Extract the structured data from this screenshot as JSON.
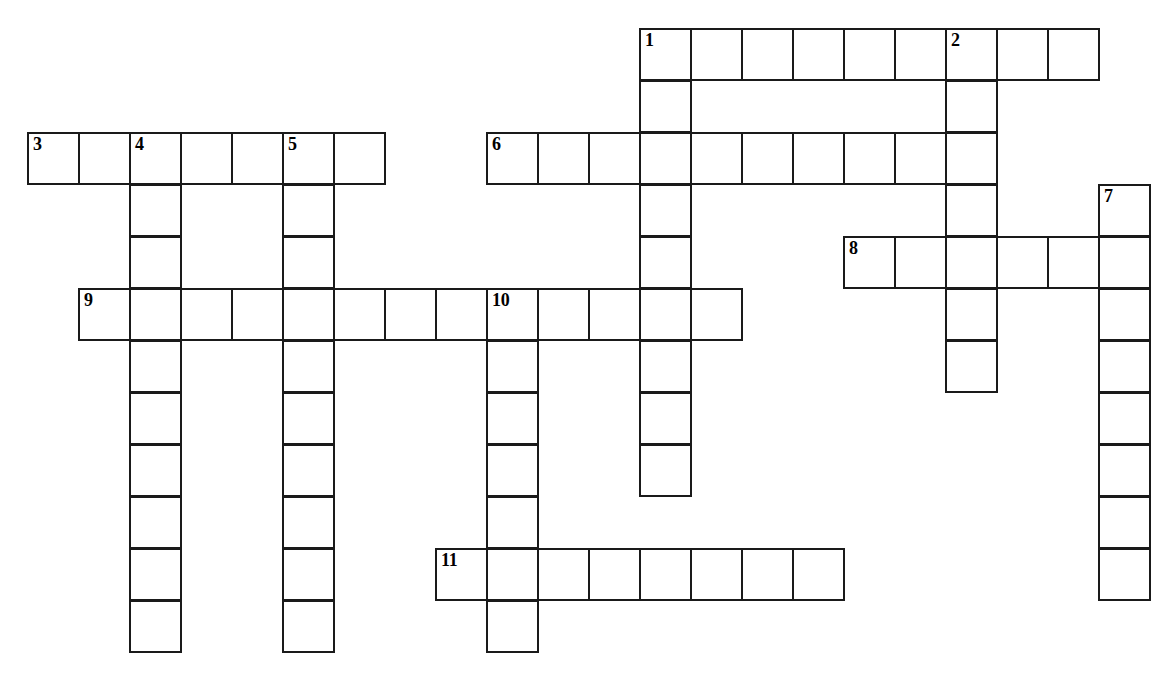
{
  "puzzle": {
    "type": "crossword-grid",
    "title": "Crossword puzzle grid",
    "background_color": "#ffffff",
    "cell_border_color": "#1a1a1a",
    "cell_size_px": 51,
    "row_height_px": 52,
    "origin_x_px": 27,
    "origin_y_px": 28,
    "grid_columns": 22,
    "grid_rows": 13,
    "number_count": 11,
    "entries": [
      {
        "number": "1",
        "direction": "across",
        "row": 0,
        "col": 12,
        "length": 9,
        "numbered_cell_index": 0
      },
      {
        "number": "1",
        "direction": "down",
        "row": 0,
        "col": 12,
        "length": 9,
        "numbered_cell_index": 0
      },
      {
        "number": "2",
        "direction": "down",
        "row": 0,
        "col": 18,
        "length": 7,
        "numbered_cell_index": 0
      },
      {
        "number": "3",
        "direction": "across",
        "row": 2,
        "col": 0,
        "length": 7,
        "numbered_cell_index": 0
      },
      {
        "number": "4",
        "direction": "down",
        "row": 2,
        "col": 2,
        "length": 10,
        "numbered_cell_index": 0
      },
      {
        "number": "5",
        "direction": "down",
        "row": 2,
        "col": 5,
        "length": 10,
        "numbered_cell_index": 0
      },
      {
        "number": "6",
        "direction": "across",
        "row": 2,
        "col": 9,
        "length": 10,
        "numbered_cell_index": 0
      },
      {
        "number": "7",
        "direction": "down",
        "row": 3,
        "col": 21,
        "length": 8,
        "numbered_cell_index": 0
      },
      {
        "number": "8",
        "direction": "across",
        "row": 4,
        "col": 16,
        "length": 6,
        "numbered_cell_index": 0
      },
      {
        "number": "9",
        "direction": "across",
        "row": 5,
        "col": 1,
        "length": 13,
        "numbered_cell_index": 0
      },
      {
        "number": "10",
        "direction": "down",
        "row": 5,
        "col": 9,
        "length": 8,
        "numbered_cell_index": 0
      },
      {
        "number": "11",
        "direction": "across",
        "row": 10,
        "col": 8,
        "length": 8,
        "numbered_cell_index": 0
      }
    ],
    "cells": [
      {
        "col": 12,
        "row": 0,
        "number": "1",
        "letter": ""
      },
      {
        "col": 13,
        "row": 0,
        "number": "",
        "letter": ""
      },
      {
        "col": 14,
        "row": 0,
        "number": "",
        "letter": ""
      },
      {
        "col": 15,
        "row": 0,
        "number": "",
        "letter": ""
      },
      {
        "col": 16,
        "row": 0,
        "number": "",
        "letter": ""
      },
      {
        "col": 17,
        "row": 0,
        "number": "",
        "letter": ""
      },
      {
        "col": 18,
        "row": 0,
        "number": "2",
        "letter": ""
      },
      {
        "col": 19,
        "row": 0,
        "number": "",
        "letter": ""
      },
      {
        "col": 20,
        "row": 0,
        "number": "",
        "letter": ""
      },
      {
        "col": 12,
        "row": 1,
        "number": "",
        "letter": ""
      },
      {
        "col": 18,
        "row": 1,
        "number": "",
        "letter": ""
      },
      {
        "col": 0,
        "row": 2,
        "number": "3",
        "letter": ""
      },
      {
        "col": 1,
        "row": 2,
        "number": "",
        "letter": ""
      },
      {
        "col": 2,
        "row": 2,
        "number": "4",
        "letter": ""
      },
      {
        "col": 3,
        "row": 2,
        "number": "",
        "letter": ""
      },
      {
        "col": 4,
        "row": 2,
        "number": "",
        "letter": ""
      },
      {
        "col": 5,
        "row": 2,
        "number": "5",
        "letter": ""
      },
      {
        "col": 6,
        "row": 2,
        "number": "",
        "letter": ""
      },
      {
        "col": 9,
        "row": 2,
        "number": "6",
        "letter": ""
      },
      {
        "col": 10,
        "row": 2,
        "number": "",
        "letter": ""
      },
      {
        "col": 11,
        "row": 2,
        "number": "",
        "letter": ""
      },
      {
        "col": 12,
        "row": 2,
        "number": "",
        "letter": ""
      },
      {
        "col": 13,
        "row": 2,
        "number": "",
        "letter": ""
      },
      {
        "col": 14,
        "row": 2,
        "number": "",
        "letter": ""
      },
      {
        "col": 15,
        "row": 2,
        "number": "",
        "letter": ""
      },
      {
        "col": 16,
        "row": 2,
        "number": "",
        "letter": ""
      },
      {
        "col": 17,
        "row": 2,
        "number": "",
        "letter": ""
      },
      {
        "col": 18,
        "row": 2,
        "number": "",
        "letter": ""
      },
      {
        "col": 2,
        "row": 3,
        "number": "",
        "letter": ""
      },
      {
        "col": 5,
        "row": 3,
        "number": "",
        "letter": ""
      },
      {
        "col": 12,
        "row": 3,
        "number": "",
        "letter": ""
      },
      {
        "col": 18,
        "row": 3,
        "number": "",
        "letter": ""
      },
      {
        "col": 21,
        "row": 3,
        "number": "7",
        "letter": ""
      },
      {
        "col": 2,
        "row": 4,
        "number": "",
        "letter": ""
      },
      {
        "col": 5,
        "row": 4,
        "number": "",
        "letter": ""
      },
      {
        "col": 12,
        "row": 4,
        "number": "",
        "letter": ""
      },
      {
        "col": 16,
        "row": 4,
        "number": "8",
        "letter": ""
      },
      {
        "col": 17,
        "row": 4,
        "number": "",
        "letter": ""
      },
      {
        "col": 18,
        "row": 4,
        "number": "",
        "letter": ""
      },
      {
        "col": 19,
        "row": 4,
        "number": "",
        "letter": ""
      },
      {
        "col": 20,
        "row": 4,
        "number": "",
        "letter": ""
      },
      {
        "col": 21,
        "row": 4,
        "number": "",
        "letter": ""
      },
      {
        "col": 1,
        "row": 5,
        "number": "9",
        "letter": ""
      },
      {
        "col": 2,
        "row": 5,
        "number": "",
        "letter": ""
      },
      {
        "col": 3,
        "row": 5,
        "number": "",
        "letter": ""
      },
      {
        "col": 4,
        "row": 5,
        "number": "",
        "letter": ""
      },
      {
        "col": 5,
        "row": 5,
        "number": "",
        "letter": ""
      },
      {
        "col": 6,
        "row": 5,
        "number": "",
        "letter": ""
      },
      {
        "col": 7,
        "row": 5,
        "number": "",
        "letter": ""
      },
      {
        "col": 8,
        "row": 5,
        "number": "",
        "letter": ""
      },
      {
        "col": 9,
        "row": 5,
        "number": "10",
        "letter": ""
      },
      {
        "col": 10,
        "row": 5,
        "number": "",
        "letter": ""
      },
      {
        "col": 11,
        "row": 5,
        "number": "",
        "letter": ""
      },
      {
        "col": 12,
        "row": 5,
        "number": "",
        "letter": ""
      },
      {
        "col": 13,
        "row": 5,
        "number": "",
        "letter": ""
      },
      {
        "col": 18,
        "row": 5,
        "number": "",
        "letter": ""
      },
      {
        "col": 21,
        "row": 5,
        "number": "",
        "letter": ""
      },
      {
        "col": 2,
        "row": 6,
        "number": "",
        "letter": ""
      },
      {
        "col": 5,
        "row": 6,
        "number": "",
        "letter": ""
      },
      {
        "col": 9,
        "row": 6,
        "number": "",
        "letter": ""
      },
      {
        "col": 12,
        "row": 6,
        "number": "",
        "letter": ""
      },
      {
        "col": 18,
        "row": 6,
        "number": "",
        "letter": ""
      },
      {
        "col": 21,
        "row": 6,
        "number": "",
        "letter": ""
      },
      {
        "col": 2,
        "row": 7,
        "number": "",
        "letter": ""
      },
      {
        "col": 5,
        "row": 7,
        "number": "",
        "letter": ""
      },
      {
        "col": 9,
        "row": 7,
        "number": "",
        "letter": ""
      },
      {
        "col": 12,
        "row": 7,
        "number": "",
        "letter": ""
      },
      {
        "col": 21,
        "row": 7,
        "number": "",
        "letter": ""
      },
      {
        "col": 2,
        "row": 8,
        "number": "",
        "letter": ""
      },
      {
        "col": 5,
        "row": 8,
        "number": "",
        "letter": ""
      },
      {
        "col": 9,
        "row": 8,
        "number": "",
        "letter": ""
      },
      {
        "col": 12,
        "row": 8,
        "number": "",
        "letter": ""
      },
      {
        "col": 21,
        "row": 8,
        "number": "",
        "letter": ""
      },
      {
        "col": 2,
        "row": 9,
        "number": "",
        "letter": ""
      },
      {
        "col": 5,
        "row": 9,
        "number": "",
        "letter": ""
      },
      {
        "col": 9,
        "row": 9,
        "number": "",
        "letter": ""
      },
      {
        "col": 21,
        "row": 9,
        "number": "",
        "letter": ""
      },
      {
        "col": 2,
        "row": 10,
        "number": "",
        "letter": ""
      },
      {
        "col": 5,
        "row": 10,
        "number": "",
        "letter": ""
      },
      {
        "col": 8,
        "row": 10,
        "number": "11",
        "letter": ""
      },
      {
        "col": 9,
        "row": 10,
        "number": "",
        "letter": ""
      },
      {
        "col": 10,
        "row": 10,
        "number": "",
        "letter": ""
      },
      {
        "col": 11,
        "row": 10,
        "number": "",
        "letter": ""
      },
      {
        "col": 12,
        "row": 10,
        "number": "",
        "letter": ""
      },
      {
        "col": 13,
        "row": 10,
        "number": "",
        "letter": ""
      },
      {
        "col": 14,
        "row": 10,
        "number": "",
        "letter": ""
      },
      {
        "col": 15,
        "row": 10,
        "number": "",
        "letter": ""
      },
      {
        "col": 21,
        "row": 10,
        "number": "",
        "letter": ""
      },
      {
        "col": 2,
        "row": 11,
        "number": "",
        "letter": ""
      },
      {
        "col": 5,
        "row": 11,
        "number": "",
        "letter": ""
      },
      {
        "col": 9,
        "row": 11,
        "number": "",
        "letter": ""
      }
    ]
  }
}
